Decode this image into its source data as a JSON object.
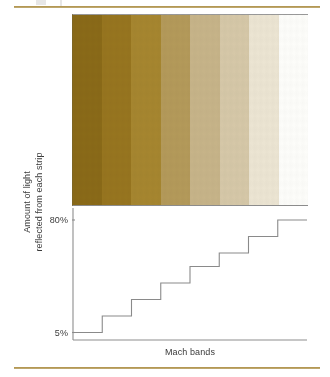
{
  "figure": {
    "caption": "Mach bands",
    "rules": {
      "color": "#a3863f"
    }
  },
  "axis": {
    "y_title_line1": "Amount of light",
    "y_title_line2": "reflected from each strip",
    "tick_top": "80%",
    "tick_bottom": "5%",
    "axis_color": "#8d8d8d",
    "step_line_color": "#8a8a8a"
  },
  "swatches": [
    {
      "name": "band-1",
      "color": "#8a6a18"
    },
    {
      "name": "band-2",
      "color": "#97751f"
    },
    {
      "name": "band-3",
      "color": "#a6862f"
    },
    {
      "name": "band-4",
      "color": "#b49a5a"
    },
    {
      "name": "band-5",
      "color": "#c7b489"
    },
    {
      "name": "band-6",
      "color": "#d6c8a8"
    },
    {
      "name": "band-7",
      "color": "#ece5d3"
    },
    {
      "name": "band-8",
      "color": "#fdfdfa"
    }
  ],
  "chart_data": {
    "type": "bar",
    "title": "Mach bands",
    "xlabel": "Mach bands",
    "ylabel": "Amount of light reflected from each strip",
    "categories": [
      "1",
      "2",
      "3",
      "4",
      "5",
      "6",
      "7",
      "8"
    ],
    "values": [
      5,
      16,
      27,
      38,
      49,
      58,
      69,
      80
    ],
    "tick_labels": [
      "5%",
      "80%"
    ],
    "ylim": [
      0,
      88
    ],
    "grid": false,
    "legend": false,
    "note": "Step function: reflectance rises in 8 equal discrete steps from 5% to 80%."
  }
}
